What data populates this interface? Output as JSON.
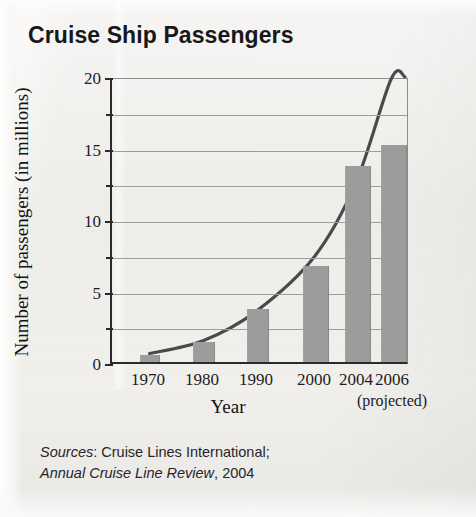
{
  "title": "Cruise Ship Passengers",
  "sources": {
    "label": "Sources",
    "separator": ": ",
    "line1_rest": "Cruise Lines International;",
    "line2_italic": "Annual Cruise Line Review",
    "line2_rest": ", 2004"
  },
  "axes": {
    "x_title": "Year",
    "y_title": "Number of passengers (in millions)",
    "projected_note": "(projected)"
  },
  "colors": {
    "bar_fill": "#9c9c9c",
    "curve": "#4a4a4a",
    "axis": "#2b2b2b",
    "grid": "#9d9d9d",
    "paper": "#f0efec",
    "text": "#1d1d1d"
  },
  "chart_data": {
    "type": "bar",
    "title": "Cruise Ship Passengers",
    "xlabel": "Year",
    "ylabel": "Number of passengers (in millions)",
    "categories": [
      "1970",
      "1980",
      "1990",
      "2000",
      "2004",
      "2006"
    ],
    "values": [
      0.5,
      1.4,
      3.7,
      6.7,
      13.7,
      15.2
    ],
    "ylim": [
      0,
      20
    ],
    "yticks": [
      0,
      5,
      10,
      15,
      20
    ],
    "yticks_minor": [
      2.5,
      7.5,
      12.5,
      17.5
    ],
    "grid": true,
    "legend": "none",
    "annotations": [
      "2006 value is projected"
    ],
    "overlay": {
      "type": "line",
      "name": "smooth trend curve",
      "points": [
        {
          "x": "1970",
          "y": 0.6
        },
        {
          "x": "1980",
          "y": 1.5
        },
        {
          "x": "1990",
          "y": 3.6
        },
        {
          "x": "2000",
          "y": 7.4
        },
        {
          "x": "2004",
          "y": 12.6
        },
        {
          "x": "2006",
          "y": 20.0
        }
      ]
    }
  }
}
